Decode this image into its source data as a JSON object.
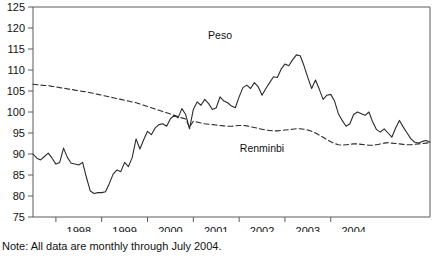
{
  "note": "Note: All data are monthly through July 2004.",
  "chart_data": {
    "type": "line",
    "title": "",
    "xlabel": "",
    "ylabel": "",
    "ylim": [
      75,
      125
    ],
    "ytick_step": 5,
    "yticks": [
      75,
      80,
      85,
      90,
      95,
      100,
      105,
      110,
      115,
      120,
      125
    ],
    "xlim": [
      "1997-07",
      "2004-07"
    ],
    "xticks": [
      1998,
      1999,
      2000,
      2001,
      2002,
      2003,
      2004
    ],
    "xtick_labels": [
      "1998",
      "1999",
      "2000",
      "2001",
      "2002",
      "2003",
      "2004"
    ],
    "grid": false,
    "legend": "inline-annotations",
    "frequency": "monthly",
    "x_start": "1997-07",
    "x_end": "2004-07",
    "annotations": [
      {
        "text": "Peso",
        "x": "2001-08",
        "y": 117.5
      },
      {
        "text": "Renminbi",
        "x": "2002-07",
        "y": 90.5
      }
    ],
    "series": [
      {
        "name": "Peso",
        "style": "solid",
        "color": "#2b2b2b",
        "values": [
          90.0,
          89.0,
          88.6,
          89.4,
          90.2,
          89.0,
          87.6,
          88.0,
          91.4,
          89.2,
          87.8,
          87.6,
          87.4,
          88.0,
          84.4,
          81.2,
          80.6,
          80.8,
          80.8,
          81.0,
          83.0,
          85.2,
          86.2,
          85.8,
          88.0,
          87.0,
          89.2,
          93.6,
          91.2,
          93.4,
          95.4,
          94.6,
          96.2,
          97.0,
          97.2,
          96.6,
          98.4,
          99.2,
          98.6,
          100.8,
          99.4,
          96.0,
          100.6,
          102.4,
          101.6,
          103.0,
          102.0,
          100.6,
          101.0,
          103.6,
          102.6,
          102.2,
          101.4,
          101.0,
          103.6,
          105.8,
          106.4,
          105.6,
          107.0,
          106.0,
          104.0,
          105.6,
          107.0,
          108.4,
          108.2,
          110.2,
          111.4,
          111.0,
          112.4,
          113.6,
          113.4,
          111.0,
          108.2,
          105.6,
          107.6,
          105.4,
          103.0,
          104.0,
          104.2,
          102.6,
          99.6,
          98.0,
          96.6,
          97.2,
          99.4,
          100.0,
          99.6,
          99.2,
          100.0,
          97.6,
          95.8,
          95.2,
          96.0,
          95.0,
          94.0,
          96.2,
          98.0,
          96.4,
          95.0,
          93.6,
          92.8,
          92.6,
          93.0,
          93.2,
          92.8
        ]
      },
      {
        "name": "Renminbi",
        "style": "dashed",
        "color": "#2b2b2b",
        "values": [
          106.6,
          106.5,
          106.4,
          106.3,
          106.3,
          106.1,
          106.0,
          105.8,
          105.7,
          105.5,
          105.4,
          105.2,
          105.1,
          104.9,
          104.8,
          104.6,
          104.4,
          104.2,
          104.0,
          103.8,
          103.6,
          103.4,
          103.2,
          103.0,
          102.8,
          102.6,
          102.4,
          102.2,
          101.9,
          101.6,
          101.3,
          101.0,
          100.7,
          100.4,
          100.1,
          99.8,
          99.5,
          99.2,
          98.9,
          98.6,
          98.3,
          96.4,
          97.8,
          97.6,
          97.4,
          97.2,
          97.1,
          97.0,
          96.9,
          96.8,
          96.7,
          96.6,
          96.6,
          96.7,
          96.8,
          96.8,
          96.7,
          96.5,
          96.3,
          96.1,
          95.9,
          95.7,
          95.6,
          95.5,
          95.5,
          95.6,
          95.7,
          95.8,
          95.9,
          96.0,
          96.0,
          95.9,
          95.7,
          95.4,
          95.0,
          94.5,
          94.0,
          93.4,
          92.9,
          92.5,
          92.2,
          92.1,
          92.2,
          92.3,
          92.4,
          92.4,
          92.3,
          92.2,
          92.1,
          92.1,
          92.2,
          92.4,
          92.6,
          92.7,
          92.6,
          92.5,
          92.4,
          92.3,
          92.2,
          92.2,
          92.3,
          92.4,
          92.5,
          92.6,
          92.7
        ]
      }
    ]
  }
}
